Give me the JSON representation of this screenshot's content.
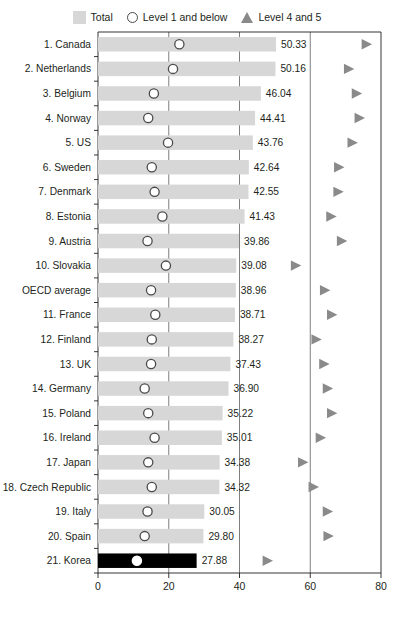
{
  "legend": {
    "items": [
      {
        "label": "Total",
        "icon": "bar-swatch-icon"
      },
      {
        "label": "Level 1 and below",
        "icon": "circle-outline-icon"
      },
      {
        "label": "Level 4 and 5",
        "icon": "triangle-right-icon"
      }
    ]
  },
  "colors": {
    "bar": "#d7d7d7",
    "bar_highlight": "#000000",
    "circle_stroke": "#4a4a4a",
    "circle_fill": "#ffffff",
    "circle_highlight_fill": "#ffffff",
    "triangle": "#8a8a8a",
    "axis": "#231f20",
    "gridline": "#6f6f6f",
    "text": "#231f20"
  },
  "chart_data": {
    "type": "bar",
    "title": "",
    "xlabel": "Proportion of professionals (%)",
    "ylabel": "",
    "xlim": [
      0,
      80
    ],
    "xticks": [
      0,
      20,
      40,
      60,
      80
    ],
    "xticklabels": [
      "0",
      "20",
      "40",
      "60",
      "80"
    ],
    "grid": true,
    "gridlines_x": [
      20,
      40,
      60
    ],
    "legend_position": "top-center",
    "orientation": "horizontal",
    "categories": [
      "1. Canada",
      "2. Netherlands",
      "3. Belgium",
      "4. Norway",
      "5. US",
      "6. Sweden",
      "7. Denmark",
      "8. Estonia",
      "9. Austria",
      "10. Slovakia",
      "OECD average",
      "11. France",
      "12. Finland",
      "13. UK",
      "14. Germany",
      "15. Poland",
      "16. Ireland",
      "17. Japan",
      "18. Czech Republic",
      "19. Italy",
      "20. Spain",
      "21. Korea"
    ],
    "series": [
      {
        "name": "Total",
        "type": "bar",
        "values": [
          50.33,
          50.16,
          46.04,
          44.41,
          43.76,
          42.64,
          42.55,
          41.43,
          39.86,
          39.08,
          38.96,
          38.71,
          38.27,
          37.43,
          36.9,
          35.22,
          35.01,
          34.38,
          34.32,
          30.05,
          29.8,
          27.88
        ],
        "labels": [
          "50.33",
          "50.16",
          "46.04",
          "44.41",
          "43.76",
          "42.64",
          "42.55",
          "41.43",
          "39.86",
          "39.08",
          "38.96",
          "38.71",
          "38.27",
          "37.43",
          "36.90",
          "35.22",
          "35.01",
          "34.38",
          "34.32",
          "30.05",
          "29.80",
          "27.88"
        ]
      },
      {
        "name": "Level 1 and below",
        "type": "scatter",
        "marker": "circle-outline",
        "values": [
          23.0,
          21.2,
          15.8,
          14.2,
          19.8,
          15.2,
          16.0,
          18.2,
          14.0,
          19.2,
          15.0,
          16.2,
          15.2,
          15.0,
          13.2,
          14.2,
          16.0,
          14.2,
          15.2,
          14.0,
          13.2,
          11.0
        ]
      },
      {
        "name": "Level 4 and 5",
        "type": "scatter",
        "marker": "triangle-right",
        "values": [
          76.0,
          71.0,
          73.2,
          74.0,
          72.0,
          68.2,
          68.0,
          66.0,
          69.0,
          56.0,
          64.2,
          66.2,
          61.8,
          64.0,
          65.0,
          66.2,
          63.0,
          58.0,
          61.0,
          65.0,
          65.2,
          48.0
        ]
      }
    ],
    "highlight_category": "21. Korea"
  }
}
